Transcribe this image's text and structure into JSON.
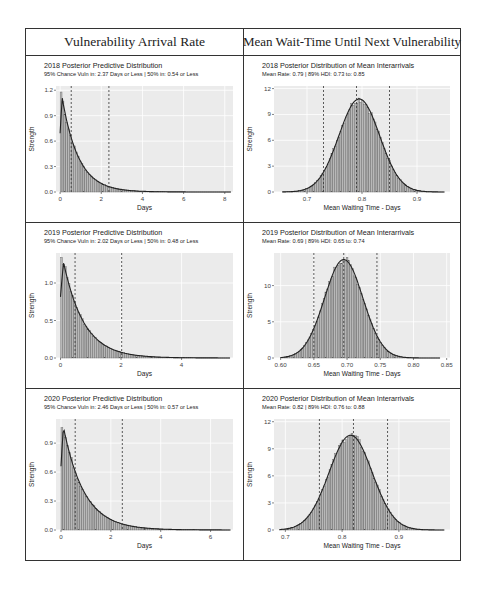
{
  "headers": {
    "left": "Vulnerability Arrival Rate",
    "right": "Mean Wait-Time Until Next Vulnerability"
  },
  "chart_data": [
    {
      "id": "arrival-2018",
      "type": "bar",
      "kind": "exponential",
      "title": "2018 Posterior Predictive Distribution",
      "subtitle": "95% Chance Vuln in: 2.37 Days or Less | 50% in: 0.54 or Less",
      "xlabel": "Days",
      "ylabel": "Strength",
      "xlim": [
        -0.2,
        8.4
      ],
      "ylim": [
        0,
        1.25
      ],
      "xticks": [
        0,
        2,
        4,
        6,
        8
      ],
      "xtick_labels": [
        "0",
        "2",
        "4",
        "6",
        "8"
      ],
      "yticks": [
        0.0,
        0.3,
        0.6,
        0.9,
        1.2
      ],
      "ytick_labels": [
        "0.0",
        "0.3",
        "0.6",
        "0.9",
        "1.2"
      ],
      "rate": 1.26,
      "peak": 1.18,
      "xmax": 8.3,
      "vlines": [
        0.54,
        2.37
      ],
      "grid": true
    },
    {
      "id": "wait-2018",
      "type": "bar",
      "kind": "normal",
      "title": "2018 Posterior Distribution of Mean Interarrivals",
      "subtitle": "Mean Rate: 0.79 | 89% HDI: 0.73 to: 0.85",
      "xlabel": "Mean Waiting Time - Days",
      "ylabel": "Strength",
      "xlim": [
        0.64,
        0.96
      ],
      "ylim": [
        0,
        12.3
      ],
      "xticks": [
        0.7,
        0.8,
        0.9
      ],
      "xtick_labels": [
        "0.7",
        "0.8",
        "0.9"
      ],
      "yticks": [
        0,
        3,
        6,
        9,
        12
      ],
      "ytick_labels": [
        "0",
        "3",
        "6",
        "9",
        "12"
      ],
      "mean": 0.795,
      "sd": 0.037,
      "peak": 10.8,
      "range": [
        0.655,
        0.95
      ],
      "vlines": [
        0.73,
        0.79,
        0.85
      ],
      "grid": true
    },
    {
      "id": "arrival-2019",
      "type": "bar",
      "kind": "exponential",
      "title": "2019 Posterior Predictive Distribution",
      "subtitle": "95% Chance Vuln in: 2.02 Days or Less | 50% in: 0.48 or Less",
      "xlabel": "Days",
      "ylabel": "Strength",
      "xlim": [
        -0.15,
        5.7
      ],
      "ylim": [
        0,
        1.4
      ],
      "xticks": [
        0,
        2,
        4
      ],
      "xtick_labels": [
        "0",
        "2",
        "4"
      ],
      "yticks": [
        0.0,
        0.5,
        1.0
      ],
      "ytick_labels": [
        "0.0",
        "0.5",
        "1.0"
      ],
      "rate": 1.48,
      "peak": 1.35,
      "xmax": 5.6,
      "vlines": [
        0.48,
        2.02
      ],
      "grid": true
    },
    {
      "id": "wait-2019",
      "type": "bar",
      "kind": "normal",
      "title": "2019 Posterior Distribution of Mean Interarrivals",
      "subtitle": "Mean Rate: 0.69 | 89% HDI: 0.65 to: 0.74",
      "xlabel": "Mean Waiting Time - Days",
      "ylabel": "Strength",
      "xlim": [
        0.59,
        0.855
      ],
      "ylim": [
        0,
        14.5
      ],
      "xticks": [
        0.6,
        0.65,
        0.7,
        0.75,
        0.8,
        0.85
      ],
      "xtick_labels": [
        "0.60",
        "0.65",
        "0.70",
        "0.75",
        "0.80",
        "0.85"
      ],
      "yticks": [
        0,
        5,
        10
      ],
      "ytick_labels": [
        "0",
        "5",
        "10"
      ],
      "mean": 0.695,
      "sd": 0.029,
      "peak": 13.6,
      "range": [
        0.6,
        0.84
      ],
      "vlines": [
        0.65,
        0.695,
        0.745
      ],
      "grid": true
    },
    {
      "id": "arrival-2020",
      "type": "bar",
      "kind": "exponential",
      "title": "2020 Posterior Predictive Distribution",
      "subtitle": "95% Chance Vuln in: 2.46 Days or Less | 50% in: 0.57 or Less",
      "xlabel": "Days",
      "ylabel": "Strength",
      "xlim": [
        -0.2,
        6.9
      ],
      "ylim": [
        0,
        1.15
      ],
      "xticks": [
        0,
        2,
        4,
        6
      ],
      "xtick_labels": [
        "0",
        "2",
        "4",
        "6"
      ],
      "yticks": [
        0.0,
        0.3,
        0.6,
        0.9
      ],
      "ytick_labels": [
        "0.0",
        "0.3",
        "0.6",
        "0.9"
      ],
      "rate": 1.2,
      "peak": 1.1,
      "xmax": 6.8,
      "vlines": [
        0.57,
        2.46
      ],
      "grid": true
    },
    {
      "id": "wait-2020",
      "type": "bar",
      "kind": "normal",
      "title": "2020 Posterior Distribution of Mean Interarrivals",
      "subtitle": "Mean Rate: 0.82 | 89% HDI: 0.76 to: 0.88",
      "xlabel": "Mean Waiting Time - Days",
      "ylabel": "Strength",
      "xlim": [
        0.68,
        0.99
      ],
      "ylim": [
        0,
        12.3
      ],
      "xticks": [
        0.7,
        0.8,
        0.9
      ],
      "xtick_labels": [
        "0.7",
        "0.8",
        "0.9"
      ],
      "yticks": [
        0,
        3,
        6,
        9,
        12
      ],
      "ytick_labels": [
        "0",
        "3",
        "6",
        "9",
        "12"
      ],
      "mean": 0.815,
      "sd": 0.038,
      "peak": 10.5,
      "range": [
        0.69,
        0.98
      ],
      "vlines": [
        0.76,
        0.82,
        0.88
      ],
      "grid": true
    }
  ]
}
